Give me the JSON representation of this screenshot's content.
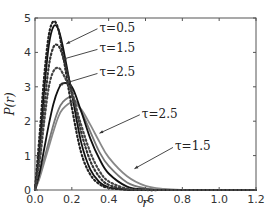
{
  "chart_data": {
    "type": "line",
    "title": "",
    "xlabel": "r",
    "ylabel": "P(r)",
    "xlim": [
      0.0,
      1.2
    ],
    "ylim": [
      0,
      5
    ],
    "xticks": [
      "0.0",
      "0.2",
      "0.4",
      "0.6",
      "0.8",
      "1.0",
      "1.2"
    ],
    "yticks": [
      "0",
      "1",
      "2",
      "3",
      "4",
      "5"
    ],
    "grid": false,
    "legend": "none (inline annotations)",
    "x": [
      0.0,
      0.025,
      0.05,
      0.075,
      0.1,
      0.125,
      0.15,
      0.2,
      0.25,
      0.3,
      0.35,
      0.4,
      0.5,
      0.6,
      0.7,
      0.8,
      1.0,
      1.2
    ],
    "series": [
      {
        "name": "tau=0.5 dotted",
        "style": "dotted",
        "color": "#222222",
        "values": [
          0,
          1.6,
          3.3,
          4.5,
          4.9,
          4.7,
          4.0,
          2.4,
          1.1,
          0.45,
          0.17,
          0.06,
          0.01,
          0,
          0,
          0,
          0,
          0
        ]
      },
      {
        "name": "tau=0.5 solid",
        "style": "solid",
        "color": "#111111",
        "values": [
          0,
          1.2,
          2.9,
          4.2,
          4.75,
          4.7,
          4.2,
          2.8,
          1.4,
          0.6,
          0.23,
          0.08,
          0.01,
          0,
          0,
          0,
          0,
          0
        ]
      },
      {
        "name": "tau=1.5 dotted",
        "style": "dotted",
        "color": "#333333",
        "values": [
          0,
          1.0,
          2.4,
          3.6,
          4.15,
          4.2,
          3.9,
          2.9,
          1.7,
          0.85,
          0.38,
          0.15,
          0.02,
          0,
          0,
          0,
          0,
          0
        ]
      },
      {
        "name": "tau=2.5 dotted",
        "style": "dotted",
        "color": "#444444",
        "values": [
          0,
          0.8,
          2.0,
          3.0,
          3.45,
          3.55,
          3.4,
          2.8,
          1.9,
          1.1,
          0.55,
          0.25,
          0.04,
          0.005,
          0,
          0,
          0,
          0
        ]
      },
      {
        "name": "tau=2.5 solid",
        "style": "solid",
        "color": "#111111",
        "values": [
          0,
          0.5,
          1.2,
          1.9,
          2.5,
          2.9,
          3.1,
          3.0,
          2.3,
          1.5,
          0.9,
          0.48,
          0.1,
          0.015,
          0,
          0,
          0,
          0
        ]
      },
      {
        "name": "tau=2.5 gray",
        "style": "solid",
        "color": "#777777",
        "values": [
          0,
          0.4,
          0.9,
          1.4,
          1.9,
          2.3,
          2.55,
          2.7,
          2.3,
          1.7,
          1.1,
          0.7,
          0.22,
          0.05,
          0.01,
          0,
          0,
          0
        ]
      },
      {
        "name": "tau=1.5 gray",
        "style": "solid",
        "color": "#888888",
        "values": [
          0,
          0.35,
          0.8,
          1.25,
          1.7,
          2.1,
          2.35,
          2.55,
          2.35,
          1.9,
          1.4,
          0.95,
          0.4,
          0.12,
          0.03,
          0.005,
          0,
          0
        ]
      }
    ],
    "annotations": [
      {
        "text": "τ=0.5",
        "x": 0.35,
        "y": 4.6,
        "arrow_to": [
          0.17,
          4.25
        ]
      },
      {
        "text": "τ=1.5",
        "x": 0.35,
        "y": 4.0,
        "arrow_to": [
          0.15,
          3.8
        ]
      },
      {
        "text": "τ=2.5",
        "x": 0.35,
        "y": 3.3,
        "arrow_to": [
          0.13,
          3.05
        ]
      },
      {
        "text": "τ=2.5",
        "x": 0.58,
        "y": 2.1,
        "arrow_to": [
          0.35,
          1.65
        ]
      },
      {
        "text": "τ=1.5",
        "x": 0.76,
        "y": 1.15,
        "arrow_to": [
          0.54,
          0.62
        ]
      }
    ]
  },
  "axes": {
    "xlabel": "r",
    "ylabel": "P(r)"
  }
}
